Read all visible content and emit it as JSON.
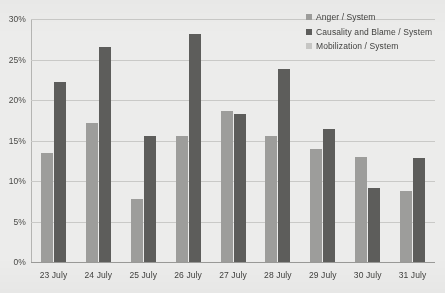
{
  "chart_data": {
    "type": "bar",
    "title": "",
    "xlabel": "",
    "ylabel": "",
    "ylim": [
      0,
      30
    ],
    "ytick_labels": [
      "0%",
      "5%",
      "10%",
      "15%",
      "20%",
      "25%",
      "30%"
    ],
    "ytick_values": [
      0,
      5,
      10,
      15,
      20,
      25,
      30
    ],
    "grid": true,
    "legend_position": "top-right",
    "categories": [
      "23 July",
      "24 July",
      "25 July",
      "26 July",
      "27 July",
      "28 July",
      "29 July",
      "30 July",
      "31 July"
    ],
    "series": [
      {
        "name": "Anger / System",
        "color": "#9d9d9b",
        "values": [
          13.4,
          17.2,
          7.8,
          15.5,
          18.6,
          15.6,
          13.9,
          13.0,
          8.8
        ]
      },
      {
        "name": "Causality and Blame / System",
        "color": "#5d5d5b",
        "values": [
          22.2,
          26.5,
          15.6,
          28.1,
          18.3,
          23.8,
          16.4,
          9.1,
          12.9
        ]
      },
      {
        "name": "Mobilization / System",
        "color": "#c6c6c4",
        "values": [
          0,
          0,
          0,
          0,
          0,
          0,
          0,
          0,
          0
        ]
      }
    ]
  },
  "colors": {
    "background": "#ececeb",
    "gridline": "#c9c9c7",
    "axis": "#9a9a98",
    "text": "#3f3f3d"
  }
}
